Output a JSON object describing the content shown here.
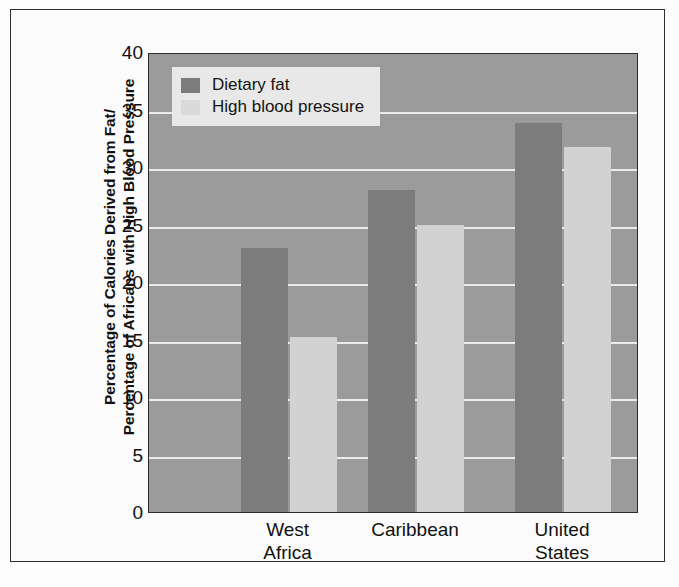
{
  "chart_data": {
    "type": "bar",
    "title": "",
    "subtitle": "",
    "xlabel": "",
    "ylabel_lines": [
      "Percentage of Calories Derived from Fat/",
      "Percentage of Africans with High Blood Pressure"
    ],
    "categories": [
      "West Africa",
      "Caribbean",
      "United States"
    ],
    "category_lines": [
      [
        "West",
        "Africa"
      ],
      [
        "Caribbean"
      ],
      [
        "United",
        "States"
      ]
    ],
    "series": [
      {
        "name": "Dietary fat",
        "color": "#7c7c7c",
        "values": [
          23,
          28,
          33.8
        ]
      },
      {
        "name": "High blood pressure",
        "color": "#d2d2d2",
        "values": [
          15.2,
          25,
          31.7
        ]
      }
    ],
    "ylim": [
      0,
      40
    ],
    "yticks": [
      0,
      5,
      10,
      15,
      20,
      25,
      30,
      35,
      40
    ],
    "ytick_labels": [
      "0",
      "5",
      "10",
      "15",
      "20",
      "25",
      "30",
      "35",
      "40"
    ],
    "grid": true,
    "gridline_color": "#f2f2f2",
    "legend_position": "top-left",
    "plot_background": "#9b9b9b",
    "figure_background": "#fbfbfb",
    "frame_color": "#2e2e2e"
  },
  "legend": {
    "items": [
      {
        "label": "Dietary fat",
        "swatch": "dark"
      },
      {
        "label": "High blood pressure",
        "swatch": "light"
      }
    ]
  }
}
